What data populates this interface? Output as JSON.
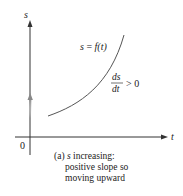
{
  "diagram": {
    "axes": {
      "x_label": "t",
      "y_label": "s",
      "origin_label": "0"
    },
    "curve_label": {
      "lhs": "s",
      "eq": " = ",
      "rhs": "f(t)"
    },
    "derivative": {
      "numerator": "ds",
      "denominator": "dt",
      "relation": "> 0"
    },
    "caption": {
      "tag": "(a) ",
      "var": "s",
      "line1_rest": " increasing:",
      "line2": "positive slope so",
      "line3": "moving upward"
    },
    "colors": {
      "axis": "#333333",
      "curve": "#555555",
      "motion_arrow": "#888888"
    }
  }
}
